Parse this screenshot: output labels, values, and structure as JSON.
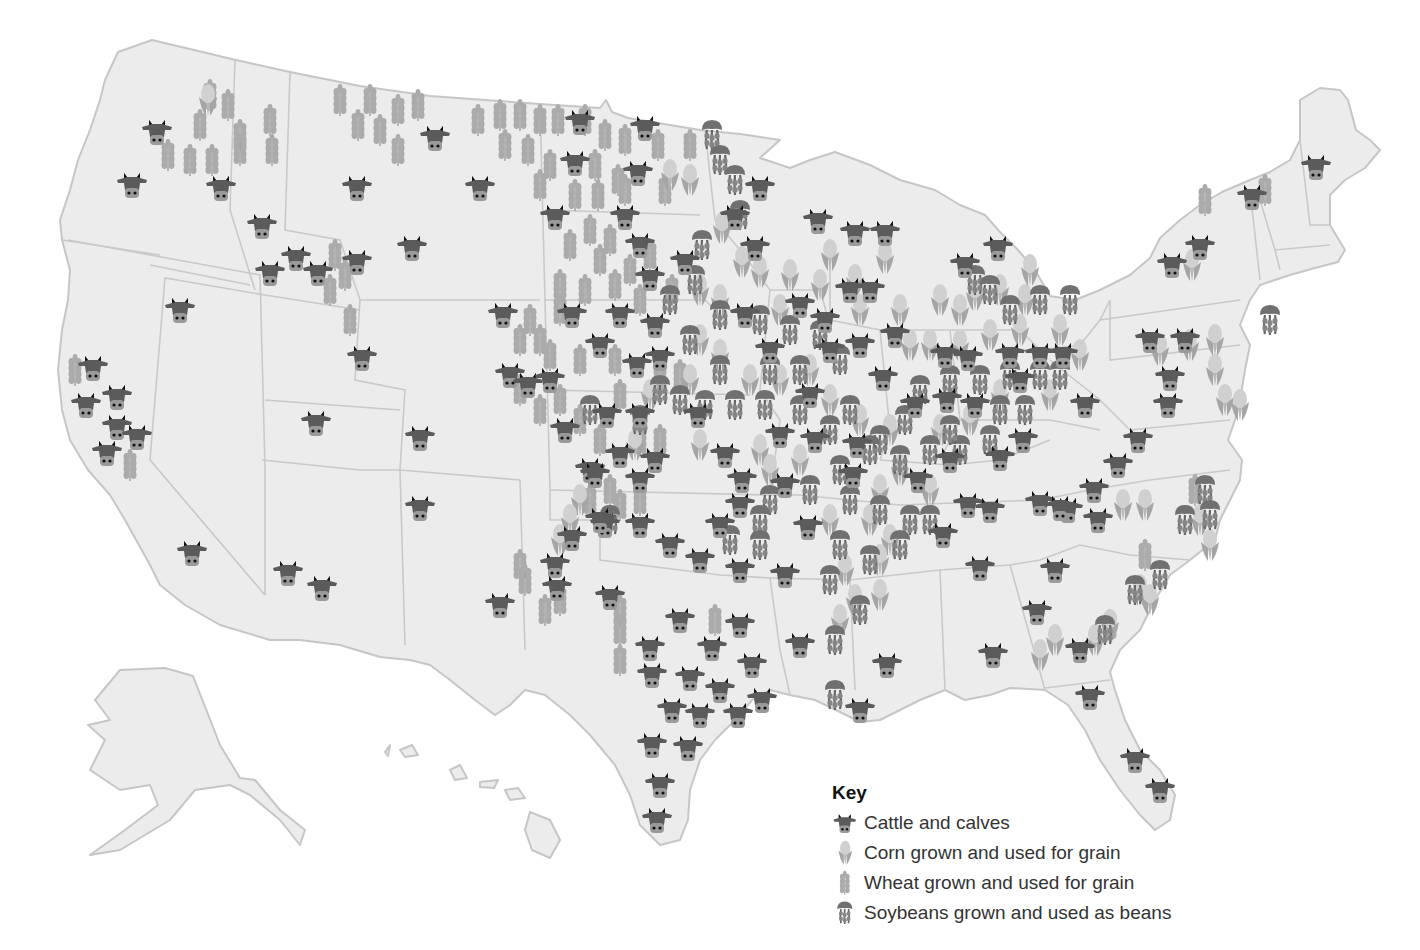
{
  "map": {
    "subject": "United States agricultural production map",
    "colors": {
      "land": "#ececec",
      "border": "#c6c6c6",
      "cattle": "#5b5b5b",
      "cattle_muzzle": "#9a9a9a",
      "corn": "#b4b4b4",
      "wheat": "#a9a9a9",
      "soybeans": "#707070"
    }
  },
  "key": {
    "title": "Key",
    "items": [
      {
        "icon": "cattle-icon",
        "label": "Cattle and calves"
      },
      {
        "icon": "corn-icon",
        "label": "Corn grown and used for grain"
      },
      {
        "icon": "wheat-icon",
        "label": "Wheat grown and used for grain"
      },
      {
        "icon": "soybeans-icon",
        "label": "Soybeans grown and used as beans"
      }
    ]
  },
  "markers": {
    "cattle": [
      [
        157,
        132
      ],
      [
        132,
        185
      ],
      [
        221,
        188
      ],
      [
        262,
        226
      ],
      [
        435,
        138
      ],
      [
        357,
        188
      ],
      [
        480,
        188
      ],
      [
        645,
        128
      ],
      [
        580,
        122
      ],
      [
        555,
        217
      ],
      [
        575,
        163
      ],
      [
        638,
        173
      ],
      [
        625,
        217
      ],
      [
        640,
        245
      ],
      [
        760,
        188
      ],
      [
        735,
        217
      ],
      [
        685,
        262
      ],
      [
        650,
        278
      ],
      [
        755,
        248
      ],
      [
        818,
        221
      ],
      [
        855,
        233
      ],
      [
        885,
        233
      ],
      [
        998,
        248
      ],
      [
        1252,
        197
      ],
      [
        1316,
        167
      ],
      [
        1200,
        247
      ],
      [
        1172,
        265
      ],
      [
        296,
        258
      ],
      [
        270,
        273
      ],
      [
        318,
        273
      ],
      [
        357,
        262
      ],
      [
        412,
        248
      ],
      [
        180,
        310
      ],
      [
        93,
        368
      ],
      [
        86,
        405
      ],
      [
        117,
        397
      ],
      [
        117,
        427
      ],
      [
        137,
        437
      ],
      [
        107,
        453
      ],
      [
        362,
        358
      ],
      [
        316,
        423
      ],
      [
        420,
        438
      ],
      [
        420,
        508
      ],
      [
        192,
        553
      ],
      [
        288,
        573
      ],
      [
        322,
        588
      ],
      [
        500,
        605
      ],
      [
        503,
        315
      ],
      [
        510,
        375
      ],
      [
        528,
        385
      ],
      [
        550,
        380
      ],
      [
        572,
        315
      ],
      [
        620,
        315
      ],
      [
        655,
        325
      ],
      [
        600,
        345
      ],
      [
        637,
        365
      ],
      [
        660,
        358
      ],
      [
        565,
        430
      ],
      [
        607,
        415
      ],
      [
        640,
        415
      ],
      [
        590,
        470
      ],
      [
        620,
        455
      ],
      [
        655,
        460
      ],
      [
        698,
        415
      ],
      [
        745,
        315
      ],
      [
        800,
        305
      ],
      [
        825,
        320
      ],
      [
        770,
        350
      ],
      [
        830,
        350
      ],
      [
        860,
        345
      ],
      [
        895,
        335
      ],
      [
        850,
        290
      ],
      [
        870,
        290
      ],
      [
        883,
        378
      ],
      [
        915,
        405
      ],
      [
        947,
        400
      ],
      [
        975,
        405
      ],
      [
        968,
        358
      ],
      [
        945,
        355
      ],
      [
        1010,
        355
      ],
      [
        1040,
        355
      ],
      [
        1063,
        355
      ],
      [
        1020,
        380
      ],
      [
        1085,
        405
      ],
      [
        1023,
        440
      ],
      [
        1000,
        458
      ],
      [
        1138,
        440
      ],
      [
        1118,
        465
      ],
      [
        1094,
        490
      ],
      [
        1040,
        503
      ],
      [
        1068,
        510
      ],
      [
        1168,
        405
      ],
      [
        1170,
        378
      ],
      [
        1150,
        340
      ],
      [
        1185,
        340
      ],
      [
        918,
        480
      ],
      [
        950,
        460
      ],
      [
        968,
        505
      ],
      [
        990,
        510
      ],
      [
        943,
        535
      ],
      [
        853,
        475
      ],
      [
        857,
        445
      ],
      [
        810,
        395
      ],
      [
        815,
        440
      ],
      [
        780,
        435
      ],
      [
        785,
        485
      ],
      [
        725,
        455
      ],
      [
        742,
        480
      ],
      [
        740,
        505
      ],
      [
        808,
        527
      ],
      [
        720,
        525
      ],
      [
        700,
        560
      ],
      [
        740,
        570
      ],
      [
        785,
        575
      ],
      [
        670,
        545
      ],
      [
        640,
        525
      ],
      [
        605,
        525
      ],
      [
        595,
        475
      ],
      [
        640,
        480
      ],
      [
        600,
        520
      ],
      [
        572,
        538
      ],
      [
        555,
        565
      ],
      [
        557,
        588
      ],
      [
        610,
        597
      ],
      [
        650,
        648
      ],
      [
        680,
        620
      ],
      [
        712,
        648
      ],
      [
        740,
        625
      ],
      [
        752,
        665
      ],
      [
        652,
        675
      ],
      [
        690,
        678
      ],
      [
        720,
        690
      ],
      [
        672,
        710
      ],
      [
        700,
        715
      ],
      [
        738,
        715
      ],
      [
        762,
        700
      ],
      [
        652,
        745
      ],
      [
        688,
        748
      ],
      [
        660,
        785
      ],
      [
        657,
        820
      ],
      [
        800,
        645
      ],
      [
        887,
        665
      ],
      [
        860,
        710
      ],
      [
        980,
        568
      ],
      [
        993,
        655
      ],
      [
        1037,
        612
      ],
      [
        1055,
        570
      ],
      [
        1098,
        520
      ],
      [
        1080,
        650
      ],
      [
        1090,
        697
      ],
      [
        1135,
        760
      ],
      [
        1160,
        790
      ],
      [
        965,
        265
      ],
      [
        1060,
        508
      ]
    ],
    "corn": [
      [
        208,
        100
      ],
      [
        1192,
        265
      ],
      [
        670,
        175
      ],
      [
        690,
        180
      ],
      [
        722,
        228
      ],
      [
        742,
        262
      ],
      [
        760,
        272
      ],
      [
        790,
        275
      ],
      [
        830,
        255
      ],
      [
        855,
        280
      ],
      [
        885,
        258
      ],
      [
        975,
        295
      ],
      [
        1000,
        290
      ],
      [
        1025,
        300
      ],
      [
        1030,
        270
      ],
      [
        960,
        310
      ],
      [
        940,
        300
      ],
      [
        700,
        290
      ],
      [
        720,
        300
      ],
      [
        780,
        310
      ],
      [
        820,
        285
      ],
      [
        860,
        310
      ],
      [
        900,
        310
      ],
      [
        910,
        345
      ],
      [
        930,
        345
      ],
      [
        960,
        345
      ],
      [
        990,
        335
      ],
      [
        1020,
        330
      ],
      [
        1060,
        330
      ],
      [
        1080,
        355
      ],
      [
        1000,
        395
      ],
      [
        1050,
        395
      ],
      [
        970,
        420
      ],
      [
        940,
        430
      ],
      [
        890,
        430
      ],
      [
        860,
        420
      ],
      [
        830,
        400
      ],
      [
        700,
        340
      ],
      [
        720,
        355
      ],
      [
        690,
        380
      ],
      [
        750,
        380
      ],
      [
        780,
        380
      ],
      [
        810,
        370
      ],
      [
        650,
        395
      ],
      [
        635,
        445
      ],
      [
        700,
        445
      ],
      [
        760,
        450
      ],
      [
        800,
        460
      ],
      [
        770,
        470
      ],
      [
        900,
        470
      ],
      [
        930,
        490
      ],
      [
        880,
        490
      ],
      [
        870,
        520
      ],
      [
        890,
        540
      ],
      [
        580,
        500
      ],
      [
        570,
        520
      ],
      [
        560,
        540
      ],
      [
        1123,
        505
      ],
      [
        1145,
        505
      ],
      [
        1200,
        520
      ],
      [
        1210,
        545
      ],
      [
        1225,
        400
      ],
      [
        1240,
        405
      ],
      [
        1215,
        370
      ],
      [
        1190,
        345
      ],
      [
        1215,
        340
      ],
      [
        1160,
        350
      ],
      [
        1040,
        655
      ],
      [
        1055,
        640
      ],
      [
        1095,
        640
      ],
      [
        1110,
        625
      ],
      [
        1140,
        590
      ],
      [
        1150,
        600
      ],
      [
        845,
        570
      ],
      [
        855,
        600
      ],
      [
        880,
        595
      ],
      [
        880,
        560
      ],
      [
        830,
        520
      ],
      [
        840,
        620
      ]
    ],
    "wheat": [
      [
        210,
        95
      ],
      [
        228,
        105
      ],
      [
        200,
        125
      ],
      [
        240,
        135
      ],
      [
        270,
        120
      ],
      [
        272,
        150
      ],
      [
        168,
        155
      ],
      [
        190,
        160
      ],
      [
        212,
        160
      ],
      [
        240,
        150
      ],
      [
        340,
        100
      ],
      [
        370,
        100
      ],
      [
        358,
        125
      ],
      [
        380,
        130
      ],
      [
        398,
        110
      ],
      [
        418,
        105
      ],
      [
        398,
        150
      ],
      [
        478,
        120
      ],
      [
        500,
        115
      ],
      [
        520,
        115
      ],
      [
        540,
        120
      ],
      [
        505,
        145
      ],
      [
        528,
        150
      ],
      [
        558,
        120
      ],
      [
        585,
        120
      ],
      [
        605,
        135
      ],
      [
        625,
        140
      ],
      [
        550,
        165
      ],
      [
        595,
        165
      ],
      [
        618,
        180
      ],
      [
        658,
        145
      ],
      [
        690,
        145
      ],
      [
        540,
        185
      ],
      [
        575,
        195
      ],
      [
        598,
        195
      ],
      [
        625,
        190
      ],
      [
        665,
        190
      ],
      [
        590,
        230
      ],
      [
        610,
        240
      ],
      [
        570,
        245
      ],
      [
        630,
        270
      ],
      [
        650,
        255
      ],
      [
        600,
        260
      ],
      [
        615,
        285
      ],
      [
        640,
        300
      ],
      [
        672,
        290
      ],
      [
        560,
        285
      ],
      [
        585,
        290
      ],
      [
        560,
        310
      ],
      [
        530,
        320
      ],
      [
        540,
        340
      ],
      [
        520,
        340
      ],
      [
        550,
        355
      ],
      [
        580,
        360
      ],
      [
        615,
        360
      ],
      [
        660,
        380
      ],
      [
        680,
        375
      ],
      [
        520,
        390
      ],
      [
        540,
        410
      ],
      [
        560,
        400
      ],
      [
        580,
        420
      ],
      [
        620,
        395
      ],
      [
        640,
        440
      ],
      [
        660,
        440
      ],
      [
        600,
        440
      ],
      [
        610,
        490
      ],
      [
        590,
        500
      ],
      [
        620,
        505
      ],
      [
        640,
        500
      ],
      [
        560,
        600
      ],
      [
        545,
        610
      ],
      [
        520,
        565
      ],
      [
        525,
        580
      ],
      [
        620,
        610
      ],
      [
        620,
        630
      ],
      [
        620,
        660
      ],
      [
        715,
        620
      ],
      [
        335,
        255
      ],
      [
        345,
        275
      ],
      [
        330,
        290
      ],
      [
        350,
        320
      ],
      [
        75,
        370
      ],
      [
        130,
        465
      ],
      [
        1195,
        490
      ],
      [
        1145,
        555
      ],
      [
        1110,
        625
      ],
      [
        1205,
        200
      ],
      [
        1265,
        190
      ]
    ],
    "soybeans": [
      [
        712,
        135
      ],
      [
        720,
        160
      ],
      [
        735,
        180
      ],
      [
        740,
        215
      ],
      [
        702,
        245
      ],
      [
        695,
        280
      ],
      [
        670,
        300
      ],
      [
        720,
        315
      ],
      [
        760,
        320
      ],
      [
        790,
        330
      ],
      [
        820,
        335
      ],
      [
        840,
        360
      ],
      [
        800,
        370
      ],
      [
        770,
        370
      ],
      [
        720,
        370
      ],
      [
        690,
        340
      ],
      [
        705,
        405
      ],
      [
        735,
        405
      ],
      [
        765,
        405
      ],
      [
        800,
        410
      ],
      [
        830,
        430
      ],
      [
        850,
        410
      ],
      [
        880,
        440
      ],
      [
        905,
        420
      ],
      [
        920,
        390
      ],
      [
        950,
        380
      ],
      [
        980,
        380
      ],
      [
        1010,
        375
      ],
      [
        1040,
        375
      ],
      [
        1060,
        375
      ],
      [
        1025,
        410
      ],
      [
        1000,
        410
      ],
      [
        990,
        440
      ],
      [
        960,
        450
      ],
      [
        930,
        450
      ],
      [
        900,
        460
      ],
      [
        870,
        450
      ],
      [
        840,
        470
      ],
      [
        810,
        490
      ],
      [
        770,
        500
      ],
      [
        760,
        520
      ],
      [
        850,
        500
      ],
      [
        880,
        510
      ],
      [
        910,
        520
      ],
      [
        930,
        520
      ],
      [
        900,
        545
      ],
      [
        870,
        560
      ],
      [
        840,
        545
      ],
      [
        830,
        580
      ],
      [
        860,
        610
      ],
      [
        835,
        640
      ],
      [
        835,
        695
      ],
      [
        950,
        430
      ],
      [
        975,
        280
      ],
      [
        990,
        290
      ],
      [
        1010,
        310
      ],
      [
        1040,
        300
      ],
      [
        1070,
        300
      ],
      [
        1205,
        490
      ],
      [
        1210,
        515
      ],
      [
        1185,
        520
      ],
      [
        1135,
        590
      ],
      [
        1160,
        575
      ],
      [
        1105,
        630
      ],
      [
        1270,
        320
      ],
      [
        680,
        400
      ],
      [
        640,
        420
      ],
      [
        660,
        390
      ],
      [
        590,
        410
      ],
      [
        610,
        520
      ],
      [
        730,
        540
      ],
      [
        760,
        545
      ]
    ]
  }
}
